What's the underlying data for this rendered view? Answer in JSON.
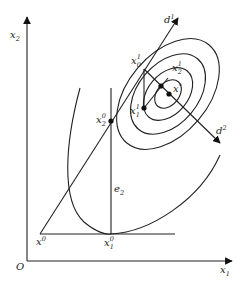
{
  "figure": {
    "axes": {
      "x_label": "x",
      "x_sub": "1",
      "y_label": "x",
      "y_sub": "2",
      "origin": "O"
    },
    "points": {
      "x0": {
        "base": "x",
        "sup": "0"
      },
      "x10": {
        "base": "x",
        "sup": "0",
        "sub": "1"
      },
      "x20": {
        "base": "x",
        "sup": "0",
        "sub": "2"
      },
      "x01": {
        "base": "x",
        "sup": "1",
        "sub": "0"
      },
      "x11": {
        "base": "x",
        "sup": "1",
        "sub": "1"
      },
      "x21": {
        "base": "x",
        "sup": "1",
        "sub": "2"
      },
      "xstar": {
        "base": "x",
        "sup": "*"
      }
    },
    "directions": {
      "d1": {
        "base": "d",
        "sup": "1"
      },
      "d2": {
        "base": "d",
        "sup": "2"
      },
      "e2": {
        "base": "e",
        "sub": "2"
      }
    },
    "colors": {
      "ink": "#222222",
      "background": "#ffffff"
    }
  }
}
